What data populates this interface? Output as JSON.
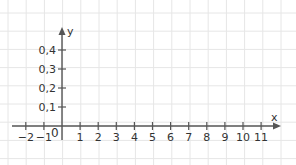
{
  "diagram": {
    "type": "coordinate-system",
    "axes": {
      "x_label": "x",
      "y_label": "y",
      "origin_label": "0"
    },
    "x_ticks": [
      "−2",
      "−1",
      "1",
      "2",
      "3",
      "4",
      "5",
      "6",
      "7",
      "8",
      "9",
      "10",
      "11"
    ],
    "x_tick_values": [
      -2,
      -1,
      1,
      2,
      3,
      4,
      5,
      6,
      7,
      8,
      9,
      10,
      11
    ],
    "y_ticks": [
      "0,1",
      "0,2",
      "0,3",
      "0,4"
    ],
    "y_tick_values": [
      0.1,
      0.2,
      0.3,
      0.4
    ],
    "colors": {
      "grid": "#e6e6e6",
      "axis": "#555555",
      "text": "#333333"
    }
  }
}
